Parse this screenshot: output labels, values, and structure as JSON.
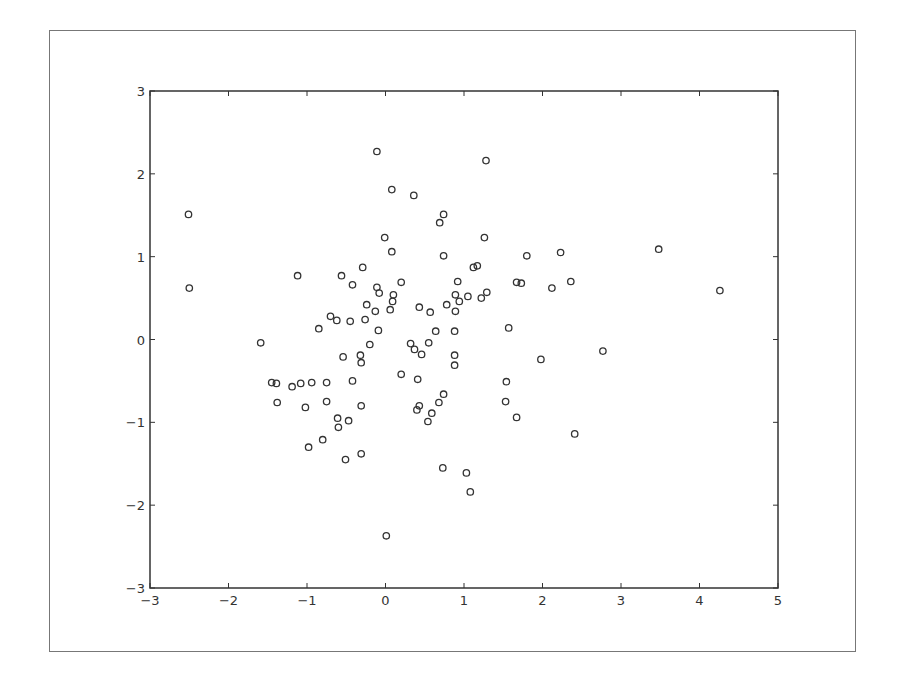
{
  "chart_data": {
    "type": "scatter",
    "title": "",
    "xlabel": "",
    "ylabel": "",
    "xlim": [
      -3,
      5
    ],
    "ylim": [
      -3,
      3
    ],
    "grid": false,
    "legend": null,
    "marker": "open-circle",
    "xticks": [
      -3,
      -2,
      -1,
      0,
      1,
      2,
      3,
      4,
      5
    ],
    "yticks": [
      -3,
      -2,
      -1,
      0,
      1,
      2,
      3
    ],
    "xtick_labels": [
      "−3",
      "−2",
      "−1",
      "0",
      "1",
      "2",
      "3",
      "4",
      "5"
    ],
    "ytick_labels": [
      "−3",
      "−2",
      "−1",
      "0",
      "1",
      "2",
      "3"
    ],
    "points": [
      [
        -2.51,
        1.51
      ],
      [
        -2.5,
        0.62
      ],
      [
        -1.59,
        -0.04
      ],
      [
        -1.12,
        0.77
      ],
      [
        -0.56,
        0.77
      ],
      [
        -0.42,
        0.66
      ],
      [
        -0.7,
        0.28
      ],
      [
        -0.62,
        0.23
      ],
      [
        -0.85,
        0.13
      ],
      [
        -0.45,
        0.22
      ],
      [
        -0.11,
        2.27
      ],
      [
        1.28,
        2.16
      ],
      [
        0.08,
        1.81
      ],
      [
        0.36,
        1.74
      ],
      [
        0.74,
        1.51
      ],
      [
        0.69,
        1.41
      ],
      [
        -0.01,
        1.23
      ],
      [
        1.26,
        1.23
      ],
      [
        0.08,
        1.06
      ],
      [
        0.74,
        1.01
      ],
      [
        1.8,
        1.01
      ],
      [
        -0.29,
        0.87
      ],
      [
        1.12,
        0.87
      ],
      [
        1.17,
        0.89
      ],
      [
        -0.11,
        0.63
      ],
      [
        -0.08,
        0.56
      ],
      [
        0.2,
        0.69
      ],
      [
        -0.24,
        0.42
      ],
      [
        0.1,
        0.54
      ],
      [
        0.09,
        0.46
      ],
      [
        0.06,
        0.36
      ],
      [
        -0.13,
        0.34
      ],
      [
        -0.26,
        0.24
      ],
      [
        -0.09,
        0.11
      ],
      [
        0.43,
        0.39
      ],
      [
        0.57,
        0.33
      ],
      [
        0.78,
        0.42
      ],
      [
        0.89,
        0.54
      ],
      [
        0.94,
        0.46
      ],
      [
        1.05,
        0.52
      ],
      [
        1.22,
        0.5
      ],
      [
        1.29,
        0.57
      ],
      [
        0.92,
        0.7
      ],
      [
        0.89,
        0.34
      ],
      [
        0.64,
        0.1
      ],
      [
        0.88,
        0.1
      ],
      [
        -0.2,
        -0.06
      ],
      [
        -0.54,
        -0.21
      ],
      [
        -0.32,
        -0.19
      ],
      [
        -0.31,
        -0.28
      ],
      [
        0.32,
        -0.05
      ],
      [
        0.55,
        -0.04
      ],
      [
        0.37,
        -0.12
      ],
      [
        0.46,
        -0.18
      ],
      [
        0.88,
        -0.19
      ],
      [
        0.88,
        -0.31
      ],
      [
        0.2,
        -0.42
      ],
      [
        0.41,
        -0.48
      ],
      [
        -1.45,
        -0.52
      ],
      [
        -1.39,
        -0.53
      ],
      [
        -1.19,
        -0.57
      ],
      [
        -1.08,
        -0.53
      ],
      [
        -0.94,
        -0.52
      ],
      [
        -0.75,
        -0.52
      ],
      [
        -0.42,
        -0.5
      ],
      [
        -1.38,
        -0.76
      ],
      [
        -1.02,
        -0.82
      ],
      [
        -0.75,
        -0.75
      ],
      [
        -0.31,
        -0.8
      ],
      [
        -0.61,
        -0.95
      ],
      [
        -0.47,
        -0.98
      ],
      [
        -0.6,
        -1.06
      ],
      [
        -0.8,
        -1.21
      ],
      [
        -0.98,
        -1.3
      ],
      [
        -0.51,
        -1.45
      ],
      [
        -0.31,
        -1.38
      ],
      [
        0.74,
        -0.66
      ],
      [
        0.68,
        -0.76
      ],
      [
        0.43,
        -0.8
      ],
      [
        0.4,
        -0.85
      ],
      [
        0.59,
        -0.89
      ],
      [
        0.54,
        -0.99
      ],
      [
        1.54,
        -0.51
      ],
      [
        1.53,
        -0.75
      ],
      [
        1.67,
        -0.94
      ],
      [
        0.73,
        -1.55
      ],
      [
        1.03,
        -1.61
      ],
      [
        1.08,
        -1.84
      ],
      [
        0.01,
        -2.37
      ],
      [
        1.67,
        0.69
      ],
      [
        1.73,
        0.68
      ],
      [
        2.12,
        0.62
      ],
      [
        2.23,
        1.05
      ],
      [
        2.36,
        0.7
      ],
      [
        1.57,
        0.14
      ],
      [
        1.98,
        -0.24
      ],
      [
        2.77,
        -0.14
      ],
      [
        2.41,
        -1.14
      ],
      [
        3.48,
        1.09
      ],
      [
        4.26,
        0.59
      ]
    ]
  },
  "colors": {
    "marker_edge": "#333333",
    "axes": "#333333",
    "frame": "#777777",
    "background": "#ffffff"
  }
}
